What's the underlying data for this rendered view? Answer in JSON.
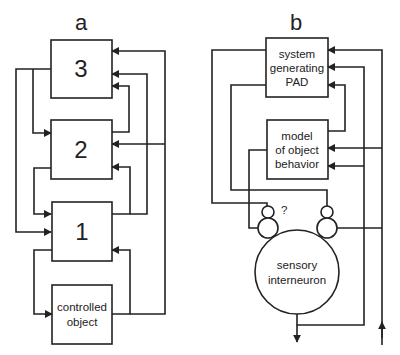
{
  "panel_a": {
    "label": "a",
    "boxes": [
      {
        "id": "3",
        "label": "3"
      },
      {
        "id": "2",
        "label": "2"
      },
      {
        "id": "1",
        "label": "1"
      },
      {
        "id": "controlled_object",
        "line1": "controlled",
        "line2": "object"
      }
    ]
  },
  "panel_b": {
    "label": "b",
    "pad_box": {
      "line1": "system",
      "line2": "generating",
      "line3": "PAD"
    },
    "model_box": {
      "line1": "model",
      "line2": "of object",
      "line3": "behavior"
    },
    "neuron": {
      "line1": "sensory",
      "line2": "interneuron"
    },
    "question_mark": "?"
  },
  "colors": {
    "stroke": "#222222",
    "background": "#ffffff"
  }
}
